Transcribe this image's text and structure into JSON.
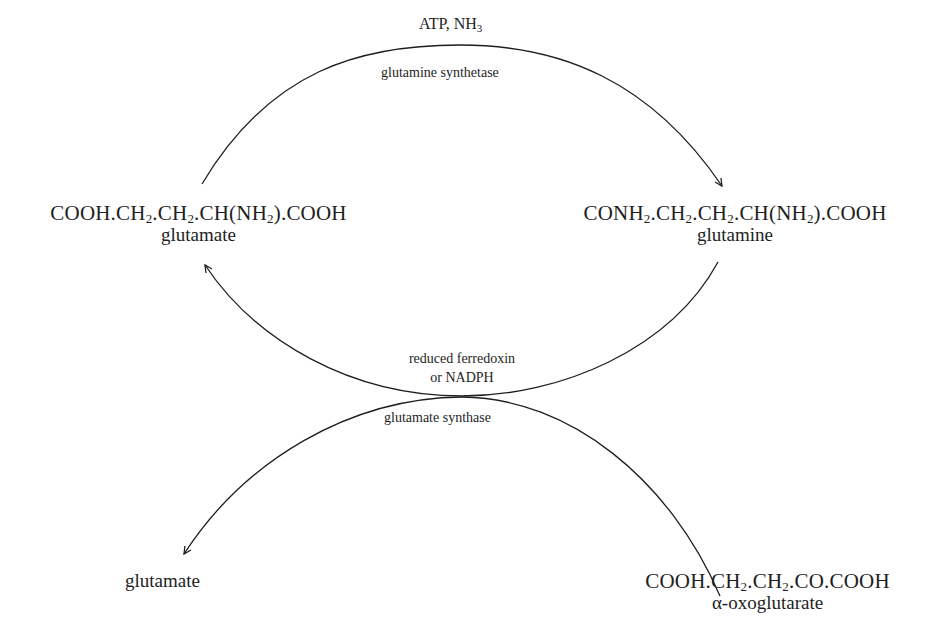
{
  "diagram": {
    "type": "metabolic-cycle",
    "top_reaction": {
      "cofactors_main": "ATP, NH",
      "cofactors_sub": "3",
      "enzyme": "glutamine synthetase"
    },
    "middle_reaction": {
      "cofactor_line1": "reduced ferredoxin",
      "cofactor_line2": "or NADPH",
      "enzyme": "glutamate synthase"
    },
    "compounds": {
      "glutamate_left": {
        "formula_parts": [
          "COOH.CH",
          "2",
          ".CH",
          "2",
          ".CH(NH",
          "2",
          ").COOH"
        ],
        "name": "glutamate"
      },
      "glutamine": {
        "formula_parts": [
          "CONH",
          "2",
          ".CH",
          "2",
          ".CH",
          "2",
          ".CH(NH",
          "2",
          ").COOH"
        ],
        "name": "glutamine"
      },
      "glutamate_bottom": {
        "name": "glutamate"
      },
      "oxoglutarate": {
        "formula_parts": [
          "COOH.CH",
          "2",
          ".CH",
          "2",
          ".CO.COOH"
        ],
        "name": "α-oxoglutarate"
      }
    },
    "colors": {
      "ink": "#1e1e1e",
      "background": "#ffffff"
    }
  }
}
